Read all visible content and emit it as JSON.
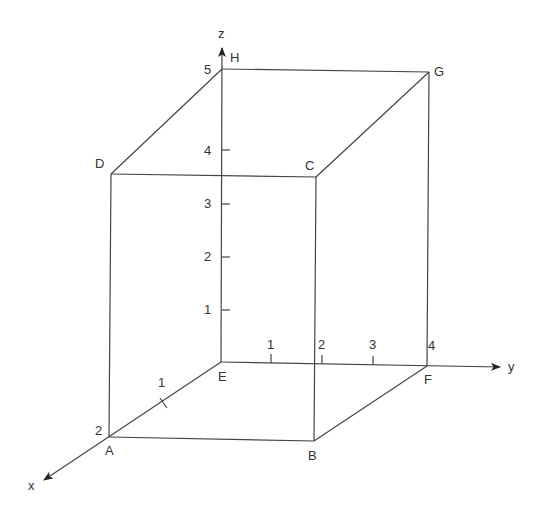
{
  "diagram": {
    "type": "3d-coordinate-box",
    "colors": {
      "line": "#444444",
      "text": "#333333",
      "background": "#ffffff"
    },
    "axes": {
      "x": {
        "label": "x",
        "ticks": [
          {
            "label": "1"
          },
          {
            "label": "2"
          }
        ]
      },
      "y": {
        "label": "y",
        "ticks": [
          {
            "label": "1"
          },
          {
            "label": "2"
          },
          {
            "label": "3"
          },
          {
            "label": "4"
          }
        ]
      },
      "z": {
        "label": "z",
        "ticks": [
          {
            "label": "1"
          },
          {
            "label": "2"
          },
          {
            "label": "3"
          },
          {
            "label": "4"
          },
          {
            "label": "5"
          }
        ]
      }
    },
    "vertices": {
      "A": "A",
      "B": "B",
      "C": "C",
      "D": "D",
      "E": "E",
      "F": "F",
      "G": "G",
      "H": "H"
    }
  }
}
